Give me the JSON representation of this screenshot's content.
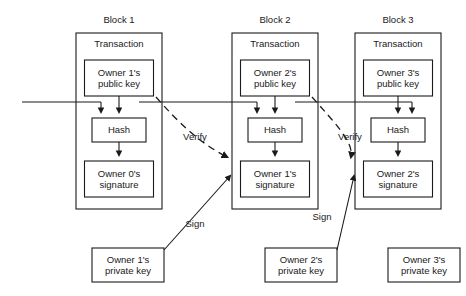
{
  "diagram": {
    "title_visible": false,
    "stroke_color": "#1a1a1a",
    "background": "#ffffff",
    "blocks": [
      {
        "id": "block1",
        "title": "Block 1",
        "transaction_label": "Transaction",
        "public_key_label": "Owner 1's\npublic key",
        "hash_label": "Hash",
        "signature_label": "Owner 0's\nsignature",
        "private_key_label": "Owner 1's\nprivate key"
      },
      {
        "id": "block2",
        "title": "Block 2",
        "transaction_label": "Transaction",
        "public_key_label": "Owner 2's\npublic key",
        "hash_label": "Hash",
        "signature_label": "Owner 1's\nsignature",
        "private_key_label": "Owner 2's\nprivate key"
      },
      {
        "id": "block3",
        "title": "Block 3",
        "transaction_label": "Transaction",
        "public_key_label": "Owner 3's\npublic key",
        "hash_label": "Hash",
        "signature_label": "Owner 2's\nsignature",
        "private_key_label": "Owner 3's\nprivate key"
      }
    ],
    "edge_labels": {
      "verify_1": "Verify",
      "verify_2": "Verify",
      "sign_1": "Sign",
      "sign_2": "Sign"
    }
  }
}
